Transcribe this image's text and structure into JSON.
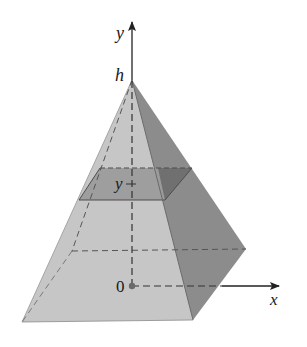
{
  "figure": {
    "type": "pyramid-cross-section",
    "labels": {
      "y_axis": "y",
      "x_axis": "x",
      "apex": "h",
      "origin": "0",
      "section_height": "y"
    },
    "colors": {
      "background": "#ffffff",
      "front_face": "#c6c6c6",
      "left_face": "#d2d2d2",
      "right_face": "#8c8c8c",
      "section_front": "#9c9c9c",
      "section_right": "#6f6f6f",
      "edge": "#5a5a5a",
      "hidden_edge": "#555555",
      "axis": "#222222"
    },
    "vertices": {
      "apex": [
        132,
        80
      ],
      "base_front_left": [
        22,
        322
      ],
      "base_front_right": [
        193,
        320
      ],
      "base_back_right": [
        246,
        249
      ],
      "base_back_left": [
        72,
        251
      ],
      "origin": [
        132,
        286
      ]
    },
    "cross_section": {
      "back_left": [
        100,
        168
      ],
      "back_right": [
        192,
        168
      ],
      "front_right": [
        165,
        200
      ],
      "front_left": [
        79,
        200
      ]
    }
  }
}
